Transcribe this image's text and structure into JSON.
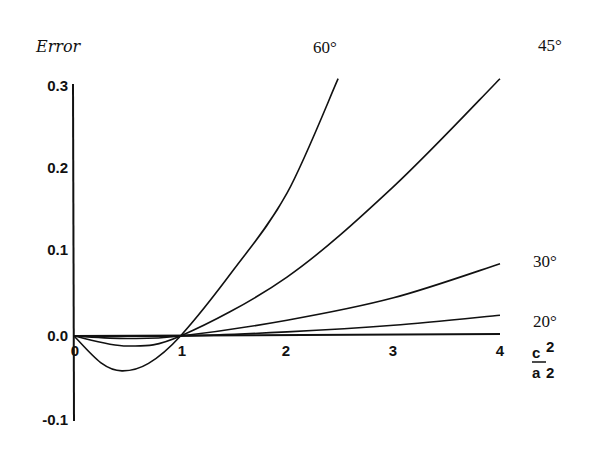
{
  "chart_data": {
    "type": "line",
    "title": "",
    "ylabel": "Error",
    "xlabel": "c²/a²",
    "xlabel_numerator": "c",
    "xlabel_numerator_exp": "2",
    "xlabel_denominator": "a",
    "xlabel_denominator_exp": "2",
    "xlim": [
      0,
      4
    ],
    "ylim": [
      -0.1,
      0.3
    ],
    "xticks": [
      "0",
      "1",
      "2",
      "3",
      "4"
    ],
    "yticks": [
      "0.3",
      "0.2",
      "0.1",
      "0.0",
      "-0.1"
    ],
    "grid": false,
    "legend_position": "inline-right",
    "series": [
      {
        "name": "60°",
        "x": [
          0,
          0.25,
          0.45,
          0.7,
          1.0,
          1.5,
          2.0,
          2.48
        ],
        "values": [
          0,
          -0.032,
          -0.042,
          -0.033,
          0,
          0.08,
          0.172,
          0.31
        ]
      },
      {
        "name": "45°",
        "x": [
          0,
          0.5,
          1.0,
          2.0,
          3.0,
          4.0
        ],
        "values": [
          0,
          -0.012,
          0,
          0.071,
          0.18,
          0.31
        ]
      },
      {
        "name": "30°",
        "x": [
          0,
          0.5,
          1.0,
          2.0,
          3.0,
          4.0
        ],
        "values": [
          0,
          -0.003,
          0,
          0.019,
          0.046,
          0.087
        ]
      },
      {
        "name": "20°",
        "x": [
          0,
          1.0,
          2.0,
          3.0,
          4.0
        ],
        "values": [
          0,
          0,
          0.005,
          0.013,
          0.025
        ]
      }
    ]
  }
}
